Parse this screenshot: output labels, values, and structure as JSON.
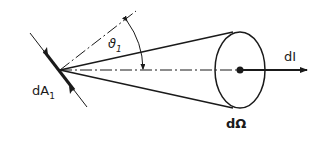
{
  "diagram": {
    "labels": {
      "area_element": "dA",
      "area_sub": "1",
      "angle": "ϑ",
      "angle_sub": "1",
      "solid_angle": "dΩ",
      "intensity": "dI"
    },
    "colors": {
      "stroke": "#1a1a1a",
      "background": "#ffffff"
    }
  }
}
